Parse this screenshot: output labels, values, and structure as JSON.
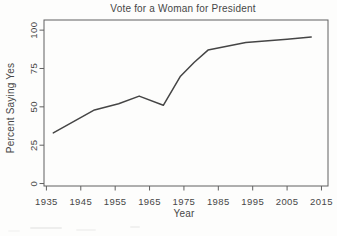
{
  "chart_data": {
    "type": "line",
    "title": "Vote for a Woman for President",
    "xlabel": "Year",
    "ylabel": "Percent Saying Yes",
    "x_ticks": [
      1935,
      1945,
      1955,
      1965,
      1975,
      1985,
      1995,
      2005,
      2015
    ],
    "y_ticks": [
      0,
      25,
      50,
      75,
      100
    ],
    "xlim": [
      1934.3,
      2016.9
    ],
    "ylim": [
      -1.6,
      106.6
    ],
    "grid": false,
    "frame": true,
    "legend": "none",
    "line_color": "#454545",
    "axis_color": "#606060",
    "text_color": "#474747",
    "background_color": "#fdfdfc",
    "series": [
      {
        "name": "Percent saying yes",
        "x": [
          1937,
          1949,
          1956,
          1962,
          1969,
          1974,
          1978,
          1982,
          1993,
          2005,
          2012
        ],
        "y": [
          33,
          48,
          52,
          57,
          51,
          70,
          79,
          87,
          92,
          94,
          95.5
        ]
      }
    ]
  }
}
